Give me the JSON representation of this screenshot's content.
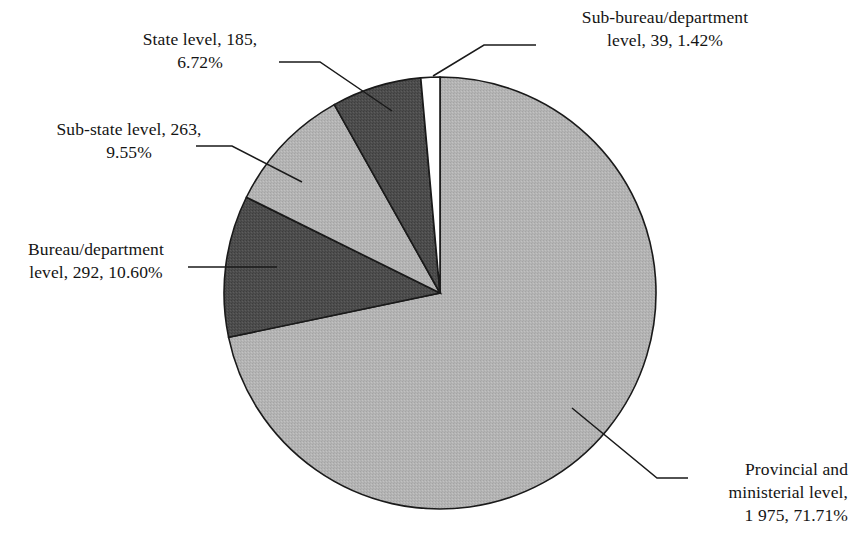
{
  "chart_data": {
    "type": "pie",
    "title": "",
    "subtitle": "",
    "xlabel": "",
    "ylabel": "",
    "legend_position": "none",
    "grid": false,
    "total": 2754,
    "value_unit": "count",
    "start_angle_deg": 0,
    "direction": "clockwise",
    "categories": [
      "Provincial and ministerial level",
      "Bureau/department level",
      "Sub-state level",
      "State level",
      "Sub-bureau/department level"
    ],
    "values": [
      1975,
      292,
      263,
      185,
      39
    ],
    "percentages": [
      71.71,
      10.6,
      9.55,
      6.72,
      1.42
    ],
    "slices": [
      {
        "name": "Provincial and ministerial level",
        "value": 1975,
        "value_text": "1 975",
        "percent": 71.71,
        "percent_text": "71.71%",
        "color": "#b2b2b2",
        "start_deg": 0,
        "end_deg": 258.16
      },
      {
        "name": "Bureau/department level",
        "value": 292,
        "value_text": "292",
        "percent": 10.6,
        "percent_text": "10.60%",
        "color": "#4d4d4d",
        "start_deg": 258.16,
        "end_deg": 296.32
      },
      {
        "name": "Sub-state level",
        "value": 263,
        "value_text": "263",
        "percent": 9.55,
        "percent_text": "9.55%",
        "color": "#b2b2b2",
        "start_deg": 296.32,
        "end_deg": 330.7
      },
      {
        "name": "State level",
        "value": 185,
        "value_text": "185",
        "percent": 6.72,
        "percent_text": "6.72%",
        "color": "#4d4d4d",
        "start_deg": 330.7,
        "end_deg": 354.89
      },
      {
        "name": "Sub-bureau/department level",
        "value": 39,
        "value_text": "39",
        "percent": 1.42,
        "percent_text": "1.42%",
        "color": "#ffffff",
        "start_deg": 354.89,
        "end_deg": 360.0
      }
    ],
    "palette": {
      "light_gray": "#b2b2b2",
      "dark_gray": "#4d4d4d",
      "white": "#ffffff",
      "outline": "#1a1a1a",
      "leader_line": "#1a1a1a",
      "text": "#141414",
      "background": "#ffffff"
    }
  },
  "labels": {
    "state_level": "State level, 185,\n6.72%",
    "sub_bureau_department_level": "Sub-bureau/department\nlevel, 39, 1.42%",
    "sub_state_level": "Sub-state level, 263,\n9.55%",
    "bureau_department_level": "Bureau/department\nlevel, 292, 10.60%",
    "provincial_ministerial_level": "Provincial and\nministerial level,\n1 975, 71.71%"
  }
}
